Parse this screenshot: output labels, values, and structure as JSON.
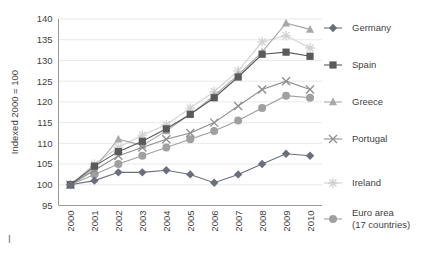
{
  "chart_data": {
    "type": "line",
    "title": "",
    "xlabel": "",
    "ylabel": "Indexed 2000 = 100",
    "x": [
      "2000",
      "2001",
      "2002",
      "2003",
      "2004",
      "2005",
      "2006",
      "2007",
      "2008",
      "2009",
      "2010"
    ],
    "ylim": [
      95,
      140
    ],
    "yticks": [
      95,
      100,
      105,
      110,
      115,
      120,
      125,
      130,
      135,
      140
    ],
    "grid": true,
    "legend_position": "right",
    "series": [
      {
        "name": "Germany",
        "marker": "diamond",
        "color": "#6b6f7a",
        "values": [
          100,
          101,
          103,
          103,
          103.5,
          102.5,
          100.5,
          102.5,
          105,
          107.5,
          107
        ]
      },
      {
        "name": "Spain",
        "marker": "square",
        "color": "#5a5a5a",
        "values": [
          100,
          104.5,
          108,
          110.5,
          113.5,
          117,
          121,
          126,
          131.5,
          132,
          131
        ]
      },
      {
        "name": "Greece",
        "marker": "triangle",
        "color": "#a8a8a8",
        "values": [
          100,
          104,
          111,
          109.5,
          113,
          117,
          121.5,
          126.5,
          132,
          139,
          137.5
        ]
      },
      {
        "name": "Portugal",
        "marker": "cross",
        "color": "#8e8e8e",
        "values": [
          100,
          103.5,
          107,
          109,
          111,
          112.5,
          115,
          119,
          123,
          125,
          123
        ]
      },
      {
        "name": "Ireland",
        "marker": "asterisk",
        "color": "#d2d2d2",
        "values": [
          100,
          105,
          109,
          112,
          114.5,
          118.5,
          122.5,
          127.5,
          134.5,
          136,
          133
        ]
      },
      {
        "name": "Euro area (17 countries)",
        "marker": "circle",
        "color": "#a0a0a0",
        "values": [
          100,
          102.5,
          105,
          107,
          109,
          111,
          113,
          115.5,
          118.5,
          121.5,
          121
        ]
      }
    ]
  },
  "legend": {
    "entries": [
      {
        "label": "Germany"
      },
      {
        "label": "Spain"
      },
      {
        "label": "Greece"
      },
      {
        "label": "Portugal"
      },
      {
        "label": "Ireland"
      },
      {
        "label": "Euro area",
        "label2": "(17 countries)"
      }
    ]
  },
  "annotations": {
    "corner_mark": "I"
  }
}
